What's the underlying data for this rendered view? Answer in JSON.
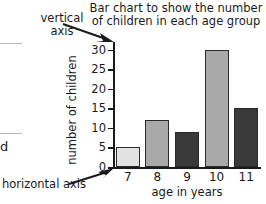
{
  "annotations": {
    "vertical_axis_label": "vertical axis",
    "horizontal_axis_label": "horizontal axis",
    "edge_letter": "d"
  },
  "chart_data": {
    "type": "bar",
    "title": "Bar chart to show the number of children in each age group",
    "categories": [
      "7",
      "8",
      "9",
      "10",
      "11"
    ],
    "values": [
      5,
      12,
      9,
      30,
      15
    ],
    "bar_colors": [
      "#e2e2e2",
      "#a9a9a9",
      "#3a3a3a",
      "#a9a9a9",
      "#3a3a3a"
    ],
    "xlabel": "age in years",
    "ylabel": "number of children",
    "ylim": [
      0,
      32
    ],
    "yticks": [
      "0",
      "5",
      "10",
      "15",
      "20",
      "25",
      "30"
    ],
    "ytick_values": [
      0,
      5,
      10,
      15,
      20,
      25,
      30
    ],
    "grid": false,
    "legend": "none"
  }
}
